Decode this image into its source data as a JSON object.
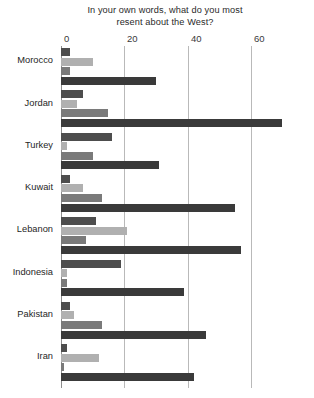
{
  "chart_data": {
    "type": "bar",
    "orientation": "horizontal",
    "title": "In your own words, what do you most resent about the West?",
    "title_line1": "In your own words, what do you most",
    "title_line2": "resent about the West?",
    "xlabel": "",
    "ylabel": "",
    "xlim": [
      0,
      80
    ],
    "xticks": [
      0,
      20,
      40,
      60,
      80
    ],
    "xtick_labels": [
      "0",
      "20",
      "40",
      "60",
      "80"
    ],
    "grid": true,
    "legend": "none",
    "categories": [
      "Morocco",
      "Jordan",
      "Turkey",
      "Kuwait",
      "Lebanon",
      "Indonesia",
      "Pakistan",
      "Iran"
    ],
    "series": [
      {
        "name": "series-1",
        "color": "#4d4d4d",
        "values": [
          3,
          7,
          16,
          3,
          11,
          19,
          3,
          2
        ]
      },
      {
        "name": "series-2",
        "color": "#b0b0b0",
        "values": [
          10,
          5,
          2,
          7,
          21,
          2,
          4,
          12
        ]
      },
      {
        "name": "series-3",
        "color": "#7a7a7a",
        "values": [
          3,
          15,
          10,
          13,
          8,
          2,
          13,
          1
        ]
      },
      {
        "name": "series-4",
        "color": "#3a3a3a",
        "values": [
          30,
          70,
          31,
          55,
          57,
          39,
          46,
          42
        ]
      }
    ]
  }
}
